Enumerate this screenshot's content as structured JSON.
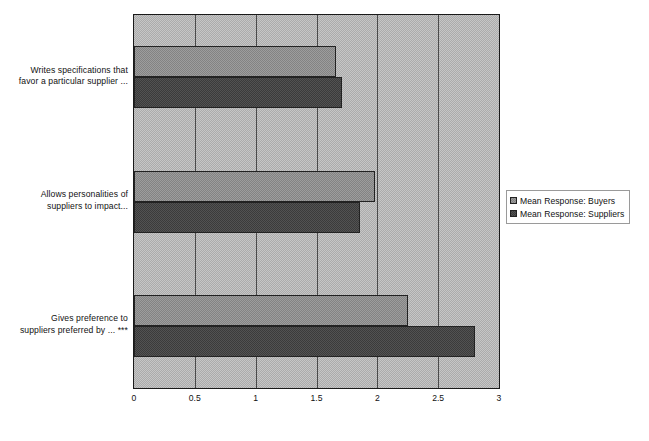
{
  "chart_data": {
    "type": "bar",
    "orientation": "horizontal",
    "title": "",
    "subtitle": "",
    "xlabel": "",
    "ylabel": "",
    "xlim": [
      0,
      3
    ],
    "xticks": [
      "0",
      "0.5",
      "1",
      "1.5",
      "2",
      "2.5",
      "3"
    ],
    "xtick_values": [
      0,
      0.5,
      1,
      1.5,
      2,
      2.5,
      3
    ],
    "grid": true,
    "grid_axis": "x",
    "legend_position": "right",
    "categories": [
      "Writes specifications that favor a particular supplier ...",
      "Allows personalities of suppliers to impact...",
      "Gives preference to suppliers preferred by ... ***"
    ],
    "category_lines": [
      [
        "Writes specifications that",
        "favor a particular supplier ..."
      ],
      [
        "Allows personalities of",
        "suppliers to impact..."
      ],
      [
        "Gives preference to",
        "suppliers preferred by ... ***"
      ]
    ],
    "series": [
      {
        "name": "Mean Response: Buyers",
        "color": "#909090",
        "values": [
          1.66,
          1.98,
          2.25
        ]
      },
      {
        "name": "Mean Response: Suppliers",
        "color": "#474747",
        "values": [
          1.71,
          1.86,
          2.8
        ]
      }
    ],
    "plot_background": "#b9b9b9"
  },
  "legend": {
    "entries": [
      "Mean Response: Buyers",
      "Mean Response: Suppliers"
    ]
  },
  "axis": {
    "x_title": ""
  }
}
